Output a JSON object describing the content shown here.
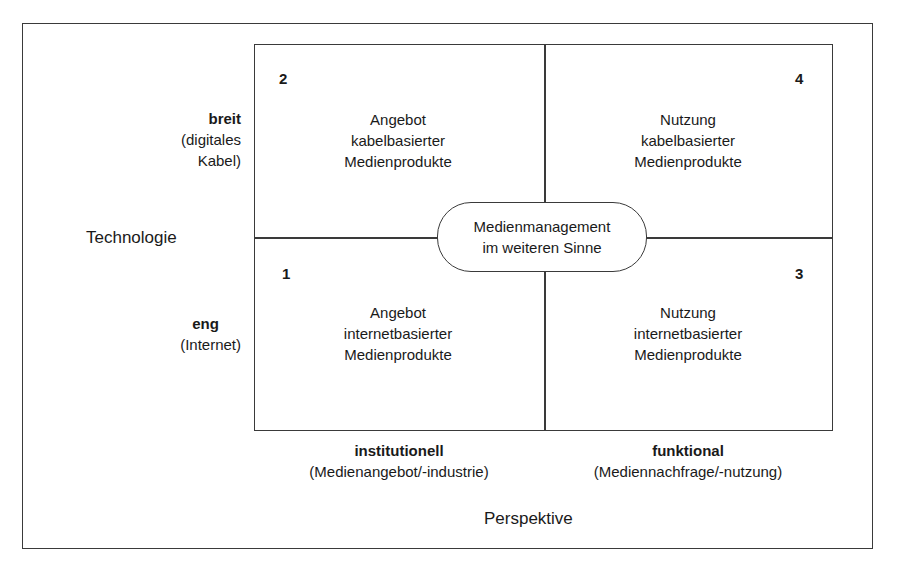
{
  "diagram": {
    "y_axis": {
      "title": "Technologie",
      "levels": [
        {
          "bold": "breit",
          "note_line1": "(digitales",
          "note_line2": "Kabel)"
        },
        {
          "bold": "eng",
          "note": "(Internet)"
        }
      ]
    },
    "x_axis": {
      "title": "Perspektive",
      "levels": [
        {
          "bold": "institutionell",
          "note": "(Medienangebot/-industrie)"
        },
        {
          "bold": "funktional",
          "note": "(Mediennachfrage/-nutzung)"
        }
      ]
    },
    "quadrants": [
      {
        "number": "2",
        "lines": [
          "Angebot",
          "kabelbasierter",
          "Medienprodukte"
        ]
      },
      {
        "number": "4",
        "lines": [
          "Nutzung",
          "kabelbasierter",
          "Medienprodukte"
        ]
      },
      {
        "number": "1",
        "lines": [
          "Angebot",
          "internetbasierter",
          "Medienprodukte"
        ]
      },
      {
        "number": "3",
        "lines": [
          "Nutzung",
          "internetbasierter",
          "Medienprodukte"
        ]
      }
    ],
    "center": {
      "line1": "Medienmanagement",
      "line2": "im weiteren Sinne"
    }
  }
}
